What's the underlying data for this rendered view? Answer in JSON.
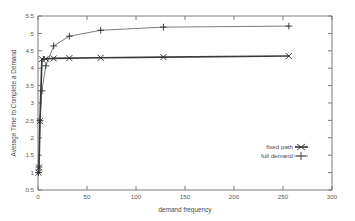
{
  "chart_data": {
    "type": "line",
    "title": "",
    "xlabel": "demand frequency",
    "ylabel": "Average Time to Complete a Demand",
    "xlim": [
      0,
      300
    ],
    "ylim": [
      0.5,
      5.5
    ],
    "xticks": [
      0,
      50,
      100,
      150,
      200,
      250,
      300
    ],
    "xticklabels": [
      "0",
      "50",
      "100",
      "150",
      "200",
      "250",
      "300"
    ],
    "yticks": [
      0.5,
      1,
      1.5,
      2,
      2.5,
      3,
      3.5,
      4,
      4.5,
      5,
      5.5
    ],
    "yticklabels": [
      "0.5",
      "1",
      "1.5",
      "2",
      "2.5",
      "3",
      "3.5",
      "4",
      "4.5",
      "5",
      "5.5"
    ],
    "grid": false,
    "legend_position": "bottom-right",
    "series": [
      {
        "name": "fixed path",
        "marker": "x",
        "x": [
          0.5,
          1,
          2,
          4,
          8,
          16,
          32,
          64,
          128,
          256
        ],
        "y": [
          1.0,
          1.15,
          2.48,
          4.26,
          4.27,
          4.28,
          4.29,
          4.3,
          4.32,
          4.35
        ]
      },
      {
        "name": "full demand",
        "marker": "plus",
        "x": [
          0.5,
          1,
          2,
          4,
          8,
          16,
          32,
          64,
          128,
          256
        ],
        "y": [
          1.0,
          1.16,
          2.49,
          3.35,
          4.07,
          4.64,
          4.92,
          5.09,
          5.18,
          5.21
        ]
      }
    ]
  },
  "legend": {
    "entries": [
      {
        "label": "fixed path"
      },
      {
        "label": "full demand"
      }
    ]
  },
  "axes": {
    "x_title": "demand frequency",
    "y_title": "Average Time to Complete a Demand"
  }
}
